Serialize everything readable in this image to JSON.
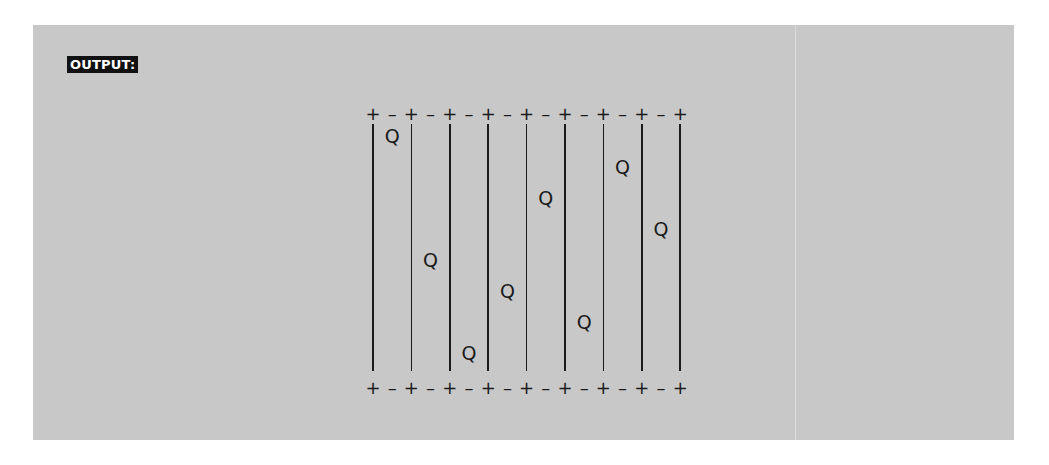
{
  "label": "OUTPUT:",
  "board": {
    "n": 8,
    "corner_glyph": "+",
    "edge_glyph": "–",
    "queen_glyph": "Q",
    "queen_rows_by_column": [
      0,
      4,
      7,
      5,
      2,
      6,
      1,
      3
    ]
  },
  "colors": {
    "panel_bg": "#c8c8c8",
    "ink": "#1a1a1a",
    "label_bg": "#111111",
    "label_fg": "#ffffff"
  }
}
